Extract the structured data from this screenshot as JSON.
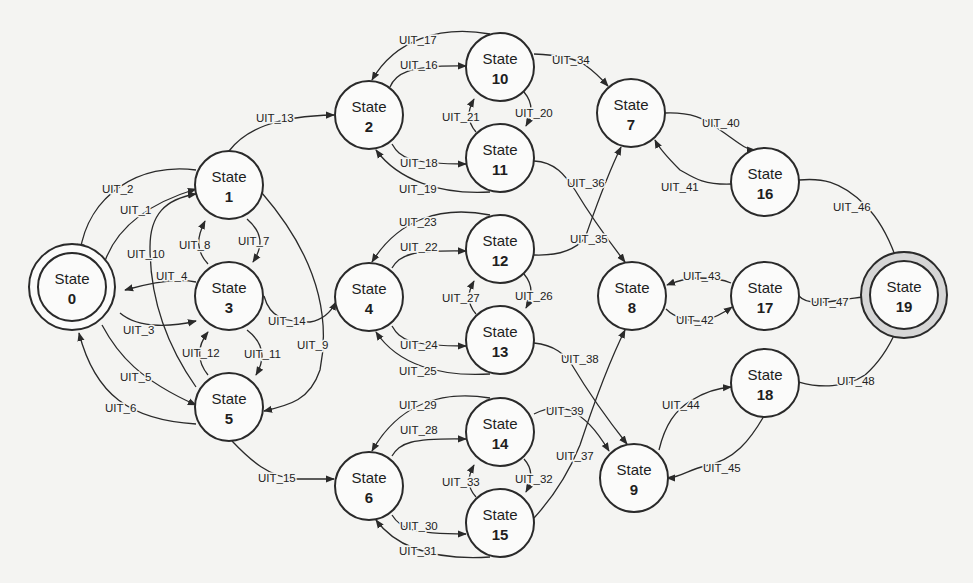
{
  "diagram": {
    "title": "",
    "type": "state-transition-diagram",
    "states": [
      {
        "id": "0",
        "title": "State",
        "number": "0",
        "x": 72,
        "y": 287,
        "r": 34,
        "kind": "initial"
      },
      {
        "id": "1",
        "title": "State",
        "number": "1",
        "x": 229,
        "y": 185,
        "r": 34,
        "kind": "normal"
      },
      {
        "id": "2",
        "title": "State",
        "number": "2",
        "x": 369,
        "y": 115,
        "r": 34,
        "kind": "normal"
      },
      {
        "id": "3",
        "title": "State",
        "number": "3",
        "x": 229,
        "y": 296,
        "r": 34,
        "kind": "normal"
      },
      {
        "id": "4",
        "title": "State",
        "number": "4",
        "x": 369,
        "y": 297,
        "r": 34,
        "kind": "normal"
      },
      {
        "id": "5",
        "title": "State",
        "number": "5",
        "x": 229,
        "y": 407,
        "r": 34,
        "kind": "normal"
      },
      {
        "id": "6",
        "title": "State",
        "number": "6",
        "x": 369,
        "y": 486,
        "r": 34,
        "kind": "normal"
      },
      {
        "id": "7",
        "title": "State",
        "number": "7",
        "x": 631,
        "y": 113,
        "r": 34,
        "kind": "normal"
      },
      {
        "id": "8",
        "title": "State",
        "number": "8",
        "x": 632,
        "y": 296,
        "r": 34,
        "kind": "normal"
      },
      {
        "id": "9",
        "title": "State",
        "number": "9",
        "x": 634,
        "y": 478,
        "r": 34,
        "kind": "normal"
      },
      {
        "id": "10",
        "title": "State",
        "number": "10",
        "x": 500,
        "y": 67,
        "r": 34,
        "kind": "normal"
      },
      {
        "id": "11",
        "title": "State",
        "number": "11",
        "x": 500,
        "y": 158,
        "r": 34,
        "kind": "normal"
      },
      {
        "id": "12",
        "title": "State",
        "number": "12",
        "x": 500,
        "y": 249,
        "r": 34,
        "kind": "normal"
      },
      {
        "id": "13",
        "title": "State",
        "number": "13",
        "x": 500,
        "y": 340,
        "r": 34,
        "kind": "normal"
      },
      {
        "id": "14",
        "title": "State",
        "number": "14",
        "x": 500,
        "y": 432,
        "r": 34,
        "kind": "normal"
      },
      {
        "id": "15",
        "title": "State",
        "number": "15",
        "x": 500,
        "y": 523,
        "r": 34,
        "kind": "normal"
      },
      {
        "id": "16",
        "title": "State",
        "number": "16",
        "x": 765,
        "y": 182,
        "r": 34,
        "kind": "normal"
      },
      {
        "id": "17",
        "title": "State",
        "number": "17",
        "x": 765,
        "y": 296,
        "r": 34,
        "kind": "normal"
      },
      {
        "id": "18",
        "title": "State",
        "number": "18",
        "x": 765,
        "y": 383,
        "r": 34,
        "kind": "normal"
      },
      {
        "id": "19",
        "title": "State",
        "number": "19",
        "x": 904,
        "y": 295,
        "r": 34,
        "kind": "accept"
      }
    ],
    "transitions": [
      {
        "label": "UIT_1",
        "from": "0",
        "to": "1",
        "d": "M 105,261 C 118,225 150,203 196,189",
        "lx": 120,
        "ly": 214
      },
      {
        "label": "UIT_2",
        "from": "1",
        "to": "0",
        "d": "M 196,170 C 140,162 88,195 80,252",
        "lx": 102,
        "ly": 193
      },
      {
        "label": "UIT_3",
        "from": "0",
        "to": "3",
        "d": "M 120,313 C 140,330 175,326 196,321",
        "lx": 123,
        "ly": 334
      },
      {
        "label": "UIT_4",
        "from": "3",
        "to": "0",
        "d": "M 196,282 C 175,278 150,283 125,290",
        "lx": 156,
        "ly": 280
      },
      {
        "label": "UIT_5",
        "from": "0",
        "to": "5",
        "d": "M 102,325 C 118,355 140,380 196,405",
        "lx": 120,
        "ly": 381
      },
      {
        "label": "UIT_6",
        "from": "5",
        "to": "0",
        "d": "M 196,424 C 130,420 95,395 79,333",
        "lx": 105,
        "ly": 412
      },
      {
        "label": "UIT_7",
        "from": "1",
        "to": "3",
        "d": "M 247,219 C 262,232 264,245 253,262",
        "lx": 238,
        "ly": 245
      },
      {
        "label": "UIT_8",
        "from": "3",
        "to": "1",
        "d": "M 208,264 C 195,250 197,237 205,221",
        "lx": 179,
        "ly": 249
      },
      {
        "label": "UIT_9",
        "from": "1",
        "to": "5",
        "d": "M 262,193 C 320,260 330,320 320,370 C 310,400 290,405 264,411",
        "lx": 297,
        "ly": 349
      },
      {
        "label": "UIT_10",
        "from": "5",
        "to": "1",
        "d": "M 196,387 C 170,350 150,305 150,247 C 150,215 165,199 196,194",
        "lx": 127,
        "ly": 258
      },
      {
        "label": "UIT_11",
        "from": "3",
        "to": "5",
        "d": "M 247,330 C 264,343 266,358 256,375",
        "lx": 244,
        "ly": 358
      },
      {
        "label": "UIT_12",
        "from": "5",
        "to": "3",
        "d": "M 208,375 C 196,360 198,345 208,332",
        "lx": 182,
        "ly": 357
      },
      {
        "label": "UIT_13",
        "from": "1",
        "to": "2",
        "d": "M 229,151 C 245,130 275,116 334,115",
        "lx": 256,
        "ly": 122
      },
      {
        "label": "UIT_14",
        "from": "3",
        "to": "4",
        "d": "M 264,296 C 270,318 285,322 310,322 C 322,320 330,314 336,302",
        "lx": 268,
        "ly": 325
      },
      {
        "label": "UIT_15",
        "from": "5",
        "to": "6",
        "d": "M 232,441 C 250,460 270,478 296,479 L 334,479",
        "lx": 258,
        "ly": 482
      },
      {
        "label": "UIT_16",
        "from": "2",
        "to": "10",
        "d": "M 390,87 C 395,75 405,65 466,66",
        "lx": 400,
        "ly": 69
      },
      {
        "label": "UIT_17",
        "from": "10",
        "to": "2",
        "d": "M 490,34 C 440,25 395,40 372,80",
        "lx": 399,
        "ly": 44
      },
      {
        "label": "UIT_18",
        "from": "2",
        "to": "11",
        "d": "M 392,144 C 400,158 410,164 466,164",
        "lx": 400,
        "ly": 167
      },
      {
        "label": "UIT_19",
        "from": "11",
        "to": "2",
        "d": "M 490,192 C 440,195 398,180 376,150",
        "lx": 399,
        "ly": 193
      },
      {
        "label": "UIT_20",
        "from": "10",
        "to": "11",
        "d": "M 524,92 C 534,104 532,115 526,126",
        "lx": 515,
        "ly": 117
      },
      {
        "label": "UIT_21",
        "from": "11",
        "to": "10",
        "d": "M 476,132 C 466,120 468,110 474,99",
        "lx": 442,
        "ly": 121
      },
      {
        "label": "UIT_22",
        "from": "4",
        "to": "12",
        "d": "M 392,268 C 400,255 410,250 466,251",
        "lx": 400,
        "ly": 251
      },
      {
        "label": "UIT_23",
        "from": "12",
        "to": "4",
        "d": "M 490,215 C 440,205 398,220 372,262",
        "lx": 399,
        "ly": 226
      },
      {
        "label": "UIT_24",
        "from": "4",
        "to": "13",
        "d": "M 392,326 C 400,340 410,346 466,346",
        "lx": 400,
        "ly": 349
      },
      {
        "label": "UIT_25",
        "from": "13",
        "to": "4",
        "d": "M 490,374 C 440,377 398,365 376,332",
        "lx": 399,
        "ly": 375
      },
      {
        "label": "UIT_26",
        "from": "12",
        "to": "13",
        "d": "M 524,274 C 534,286 532,297 526,308",
        "lx": 515,
        "ly": 300
      },
      {
        "label": "UIT_27",
        "from": "13",
        "to": "12",
        "d": "M 476,314 C 466,302 468,292 474,281",
        "lx": 442,
        "ly": 302
      },
      {
        "label": "UIT_28",
        "from": "6",
        "to": "14",
        "d": "M 392,456 C 400,443 410,438 466,439",
        "lx": 400,
        "ly": 434
      },
      {
        "label": "UIT_29",
        "from": "14",
        "to": "6",
        "d": "M 490,398 C 440,390 398,405 372,451",
        "lx": 399,
        "ly": 409
      },
      {
        "label": "UIT_30",
        "from": "6",
        "to": "15",
        "d": "M 392,515 C 400,528 410,534 466,534",
        "lx": 400,
        "ly": 530
      },
      {
        "label": "UIT_31",
        "from": "15",
        "to": "6",
        "d": "M 490,557 C 440,560 398,550 376,520",
        "lx": 399,
        "ly": 555
      },
      {
        "label": "UIT_32",
        "from": "14",
        "to": "15",
        "d": "M 524,459 C 534,470 532,481 526,492",
        "lx": 515,
        "ly": 483
      },
      {
        "label": "UIT_33",
        "from": "15",
        "to": "14",
        "d": "M 476,497 C 466,486 468,476 474,465",
        "lx": 442,
        "ly": 486
      },
      {
        "label": "UIT_34",
        "from": "10",
        "to": "7",
        "d": "M 534,54 C 560,55 575,58 585,65 C 592,70 598,75 608,86",
        "lx": 552,
        "ly": 64
      },
      {
        "label": "UIT_35",
        "from": "12",
        "to": "7",
        "d": "M 534,255 C 560,256 575,250 585,238 C 595,210 605,180 621,147",
        "lx": 570,
        "ly": 243
      },
      {
        "label": "UIT_36",
        "from": "11",
        "to": "8",
        "d": "M 534,161 C 555,162 565,175 575,190 C 590,215 608,240 625,262",
        "lx": 567,
        "ly": 187
      },
      {
        "label": "UIT_37",
        "from": "15",
        "to": "8",
        "d": "M 534,518 C 555,495 570,470 580,445 C 595,400 610,360 625,330",
        "lx": 556,
        "ly": 460
      },
      {
        "label": "UIT_38",
        "from": "13",
        "to": "9",
        "d": "M 534,343 C 555,345 565,355 572,365 C 590,395 608,420 627,444",
        "lx": 561,
        "ly": 363
      },
      {
        "label": "UIT_39",
        "from": "14",
        "to": "9",
        "d": "M 534,414 C 545,408 556,406 570,410 C 585,418 595,428 609,451",
        "lx": 546,
        "ly": 415
      },
      {
        "label": "UIT_40",
        "from": "7",
        "to": "16",
        "d": "M 665,113 C 690,112 705,118 720,130 C 735,140 745,150 755,150",
        "lx": 702,
        "ly": 127
      },
      {
        "label": "UIT_41",
        "from": "16",
        "to": "7",
        "d": "M 731,184 C 700,185 690,175 680,170 C 670,160 660,150 655,140",
        "lx": 661,
        "ly": 191
      },
      {
        "label": "UIT_42",
        "from": "8",
        "to": "17",
        "d": "M 666,309 C 675,318 690,322 703,321 C 715,318 722,314 732,307",
        "lx": 676,
        "ly": 324
      },
      {
        "label": "UIT_43",
        "from": "17",
        "to": "8",
        "d": "M 731,283 C 720,278 705,278 697,278 C 690,278 680,280 667,285",
        "lx": 683,
        "ly": 280
      },
      {
        "label": "UIT_44",
        "from": "9",
        "to": "18",
        "d": "M 659,450 C 665,425 675,410 692,400 C 705,392 718,388 731,387",
        "lx": 662,
        "ly": 409
      },
      {
        "label": "UIT_45",
        "from": "18",
        "to": "9",
        "d": "M 764,416 C 750,440 735,460 705,466 C 690,469 680,478 667,478",
        "lx": 703,
        "ly": 472
      },
      {
        "label": "UIT_46",
        "from": "16",
        "to": "19",
        "d": "M 799,180 C 820,178 840,180 865,205 C 880,220 890,240 897,261",
        "lx": 833,
        "ly": 211
      },
      {
        "label": "UIT_47",
        "from": "17",
        "to": "19",
        "d": "M 799,296 C 805,303 820,304 840,300 C 852,298 860,298 869,296",
        "lx": 811,
        "ly": 306
      },
      {
        "label": "UIT_48",
        "from": "18",
        "to": "19",
        "d": "M 799,382 C 820,388 845,388 865,375 C 880,362 890,345 897,329",
        "lx": 837,
        "ly": 385
      }
    ],
    "colors": {
      "background": "#f4f4f2",
      "stroke": "#2a2a2a",
      "node_fill": "#fbfbfa",
      "accept_ring": "#d6d6d6"
    }
  }
}
